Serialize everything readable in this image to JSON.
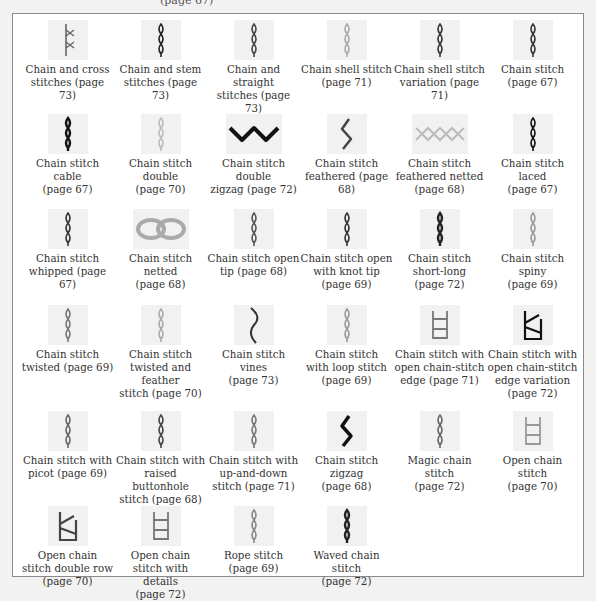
{
  "page": {
    "top_fragment": "(page 67)",
    "frame_border_color": "#8a8a8a",
    "background": "#f2f2f2"
  },
  "stitches": [
    {
      "name": "Chain and cross stitches (page 73)",
      "line1": "Chain and cross",
      "line2": "stitches (page 73)",
      "line3": "",
      "icon": "cross-chain-icon",
      "thread": "#666666"
    },
    {
      "name": "Chain and stem stitches (page 73)",
      "line1": "Chain and stem",
      "line2": "stitches (page 73)",
      "line3": "",
      "icon": "stem-chain-icon",
      "thread": "#222222"
    },
    {
      "name": "Chain and straight stitches (page 73)",
      "line1": "Chain and straight",
      "line2": "stitches (page 73)",
      "line3": "",
      "icon": "straight-chain-icon",
      "thread": "#444444"
    },
    {
      "name": "Chain shell stitch (page 71)",
      "line1": "Chain shell stitch",
      "line2": "(page 71)",
      "line3": "",
      "icon": "shell-chain-icon",
      "thread": "#aaaaaa"
    },
    {
      "name": "Chain shell stitch variation (page 71)",
      "line1": "Chain shell stitch",
      "line2": "variation (page 71)",
      "line3": "",
      "icon": "shell-variation-icon",
      "thread": "#333333"
    },
    {
      "name": "Chain stitch (page 67)",
      "line1": "Chain stitch",
      "line2": "(page 67)",
      "line3": "",
      "icon": "chain-stitch-icon",
      "thread": "#333333"
    },
    {
      "name": "Chain stitch cable (page 67)",
      "line1": "Chain stitch cable",
      "line2": "(page 67)",
      "line3": "",
      "icon": "cable-chain-icon",
      "thread": "#111111"
    },
    {
      "name": "Chain stitch double (page 70)",
      "line1": "Chain stitch double",
      "line2": "(page 70)",
      "line3": "",
      "icon": "double-chain-icon",
      "thread": "#bbbbbb"
    },
    {
      "name": "Chain stitch double zigzag (page 72)",
      "line1": "Chain stitch double",
      "line2": "zigzag (page 72)",
      "line3": "",
      "icon": "double-zigzag-icon",
      "thread": "#111111",
      "wide": true
    },
    {
      "name": "Chain stitch feathered (page 68)",
      "line1": "Chain stitch",
      "line2": "feathered (page 68)",
      "line3": "",
      "icon": "feathered-chain-icon",
      "thread": "#444444"
    },
    {
      "name": "Chain stitch feathered netted (page 68)",
      "line1": "Chain stitch",
      "line2": "feathered netted",
      "line3": "(page 68)",
      "icon": "feathered-netted-icon",
      "thread": "#bbbbbb",
      "wide": true
    },
    {
      "name": "Chain stitch laced (page 67)",
      "line1": "Chain stitch laced",
      "line2": "(page 67)",
      "line3": "",
      "icon": "laced-chain-icon",
      "thread": "#111111"
    },
    {
      "name": "Chain stitch whipped (page 67)",
      "line1": "Chain stitch",
      "line2": "whipped (page 67)",
      "line3": "",
      "icon": "whipped-chain-icon",
      "thread": "#333333"
    },
    {
      "name": "Chain stitch netted (page 68)",
      "line1": "Chain stitch netted",
      "line2": "(page 68)",
      "line3": "",
      "icon": "netted-chain-icon",
      "thread": "#aaaaaa",
      "wide": true
    },
    {
      "name": "Chain stitch open tip (page 68)",
      "line1": "Chain stitch open",
      "line2": "tip (page 68)",
      "line3": "",
      "icon": "open-tip-chain-icon",
      "thread": "#555555"
    },
    {
      "name": "Chain stitch open with knot tip (page 69)",
      "line1": "Chain stitch open",
      "line2": "with knot tip",
      "line3": "(page 69)",
      "icon": "knot-tip-chain-icon",
      "thread": "#333333"
    },
    {
      "name": "Chain stitch short-long (page 72)",
      "line1": "Chain stitch",
      "line2": "short-long",
      "line3": "(page 72)",
      "icon": "short-long-chain-icon",
      "thread": "#222222"
    },
    {
      "name": "Chain stitch spiny (page 69)",
      "line1": "Chain stitch spiny",
      "line2": "(page 69)",
      "line3": "",
      "icon": "spiny-chain-icon",
      "thread": "#999999"
    },
    {
      "name": "Chain stitch twisted (page 69)",
      "line1": "Chain stitch",
      "line2": "twisted (page 69)",
      "line3": "",
      "icon": "twisted-chain-icon",
      "thread": "#777777"
    },
    {
      "name": "Chain stitch twisted and feather stitch (page 70)",
      "line1": "Chain stitch",
      "line2": "twisted and feather",
      "line3": "stitch (page 70)",
      "icon": "twisted-feather-icon",
      "thread": "#aaaaaa"
    },
    {
      "name": "Chain stitch vines (page 73)",
      "line1": "Chain stitch vines",
      "line2": "(page 73)",
      "line3": "",
      "icon": "vines-chain-icon",
      "thread": "#333333"
    },
    {
      "name": "Chain stitch with loop stitch (page 69)",
      "line1": "Chain stitch",
      "line2": "with loop stitch",
      "line3": "(page 69)",
      "icon": "loop-chain-icon",
      "thread": "#999999"
    },
    {
      "name": "Chain stitch with open chain-stitch edge (page 71)",
      "line1": "Chain stitch with",
      "line2": "open chain-stitch",
      "line3": "edge (page 71)",
      "icon": "open-edge-chain-icon",
      "thread": "#777777"
    },
    {
      "name": "Chain stitch with open chain-stitch edge variation (page 72)",
      "line1": "Chain stitch with",
      "line2": "open chain-stitch",
      "line3": "edge variation",
      "line4": "(page 72)",
      "icon": "open-edge-variation-icon",
      "thread": "#111111"
    },
    {
      "name": "Chain stitch with picot (page 69)",
      "line1": "Chain stitch with",
      "line2": "picot (page 69)",
      "line3": "",
      "icon": "picot-chain-icon",
      "thread": "#666666"
    },
    {
      "name": "Chain stitch with raised buttonhole stitch (page 68)",
      "line1": "Chain stitch with",
      "line2": "raised buttonhole",
      "line3": "stitch (page 68)",
      "icon": "raised-buttonhole-icon",
      "thread": "#444444"
    },
    {
      "name": "Chain stitch with up-and-down stitch (page 71)",
      "line1": "Chain stitch with",
      "line2": "up-and-down",
      "line3": "stitch (page 71)",
      "icon": "up-and-down-icon",
      "thread": "#777777"
    },
    {
      "name": "Chain stitch zigzag (page 68)",
      "line1": "Chain stitch zigzag",
      "line2": "(page 68)",
      "line3": "",
      "icon": "zigzag-chain-icon",
      "thread": "#111111"
    },
    {
      "name": "Magic chain stitch (page 72)",
      "line1": "Magic chain stitch",
      "line2": "(page 72)",
      "line3": "",
      "icon": "magic-chain-icon",
      "thread": "#666666"
    },
    {
      "name": "Open chain stitch (page 70)",
      "line1": "Open chain stitch",
      "line2": "(page 70)",
      "line3": "",
      "icon": "open-chain-icon",
      "thread": "#999999"
    },
    {
      "name": "Open chain stitch double row (page 70)",
      "line1": "Open chain",
      "line2": "stitch double row",
      "line3": "(page 70)",
      "icon": "open-double-row-icon",
      "thread": "#444444"
    },
    {
      "name": "Open chain stitch with details (page 72)",
      "line1": "Open chain",
      "line2": "stitch with details",
      "line3": "(page 72)",
      "icon": "open-details-icon",
      "thread": "#777777"
    },
    {
      "name": "Rope stitch (page 69)",
      "line1": "Rope stitch",
      "line2": "(page 69)",
      "line3": "",
      "icon": "rope-stitch-icon",
      "thread": "#888888"
    },
    {
      "name": "Waved chain stitch (page 72)",
      "line1": "Waved chain stitch",
      "line2": "(page 72)",
      "line3": "",
      "icon": "waved-chain-icon",
      "thread": "#222222"
    }
  ]
}
